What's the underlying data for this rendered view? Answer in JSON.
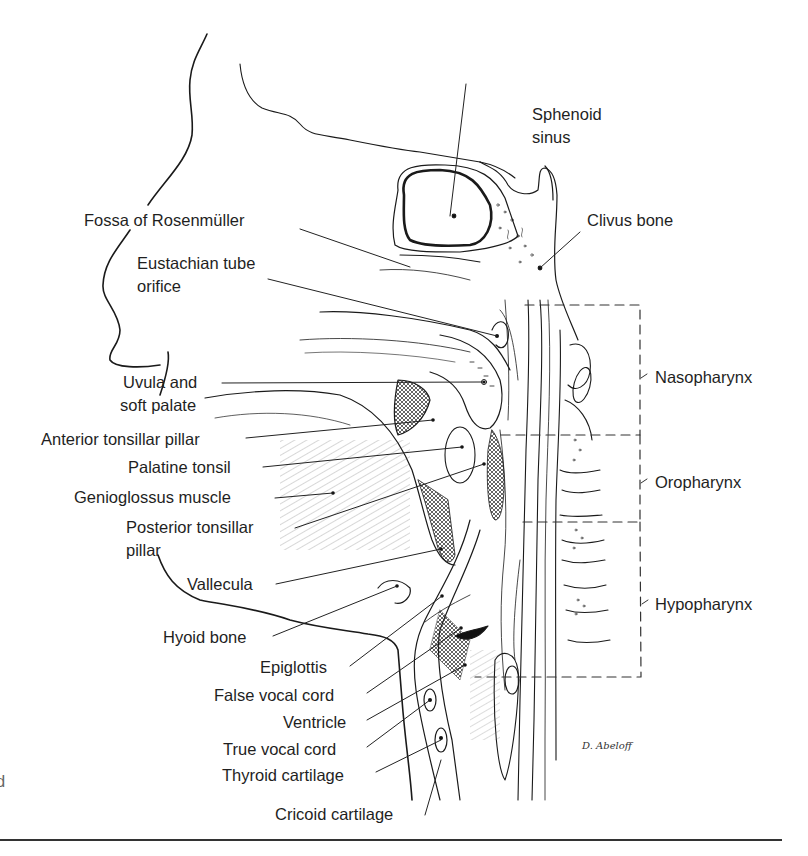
{
  "figure": {
    "type": "anatomical-illustration",
    "signature": "D. Abeloff",
    "edge_fragment": "d"
  },
  "labels": {
    "sphenoid_sinus": [
      "Sphenoid",
      "sinus"
    ],
    "clivus_bone": "Clivus bone",
    "fossa_of_rosenmuller": "Fossa of Rosenmüller",
    "eustachian_tube_orifice": [
      "Eustachian tube",
      "orifice"
    ],
    "uvula_soft_palate": [
      "Uvula and",
      "soft palate"
    ],
    "anterior_tonsillar_pillar": "Anterior tonsillar pillar",
    "palatine_tonsil": "Palatine tonsil",
    "genioglossus_muscle": "Genioglossus muscle",
    "posterior_tonsillar_pillar": [
      "Posterior tonsillar",
      "pillar"
    ],
    "vallecula": "Vallecula",
    "hyoid_bone": "Hyoid bone",
    "epiglottis": "Epiglottis",
    "false_vocal_cord": "False vocal cord",
    "ventricle": "Ventricle",
    "true_vocal_cord": "True vocal cord",
    "thyroid_cartilage": "Thyroid cartilage",
    "cricoid_cartilage": "Cricoid cartilage"
  },
  "regions": {
    "nasopharynx": "Nasopharynx",
    "oropharynx": "Oropharynx",
    "hypopharynx": "Hypopharynx"
  }
}
